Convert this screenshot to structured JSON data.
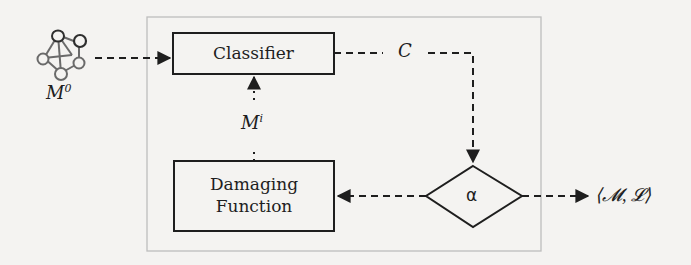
{
  "diagram": {
    "nodes": {
      "model_input": {
        "icon": "network-graph-icon",
        "label_base": "M",
        "label_sup": "0"
      },
      "classifier": {
        "label": "Classifier"
      },
      "damaging_function": {
        "label_line1": "Damaging",
        "label_line2": "Function"
      },
      "decision": {
        "label": "α"
      },
      "output": {
        "label": "⟨𝓜, 𝓛⟩"
      }
    },
    "edges": [
      {
        "from": "model_input",
        "to": "classifier",
        "style": "dashed",
        "label": ""
      },
      {
        "from": "classifier",
        "to": "decision",
        "style": "dashed",
        "label": "C"
      },
      {
        "from": "decision",
        "to": "damaging_function",
        "style": "dashed",
        "label": ""
      },
      {
        "from": "damaging_function",
        "to": "classifier",
        "style": "dotted",
        "label_base": "M",
        "label_sup": "i"
      },
      {
        "from": "decision",
        "to": "output",
        "style": "dashed",
        "label": ""
      }
    ],
    "edge_labels": {
      "classifier_output": "C",
      "damaged_model_base": "M",
      "damaged_model_sup": "i"
    },
    "colors": {
      "stroke": "#1e1e1e",
      "frame": "#bdbdbd",
      "icon": "#6a6a6a",
      "background": "#f4f3f1"
    }
  }
}
